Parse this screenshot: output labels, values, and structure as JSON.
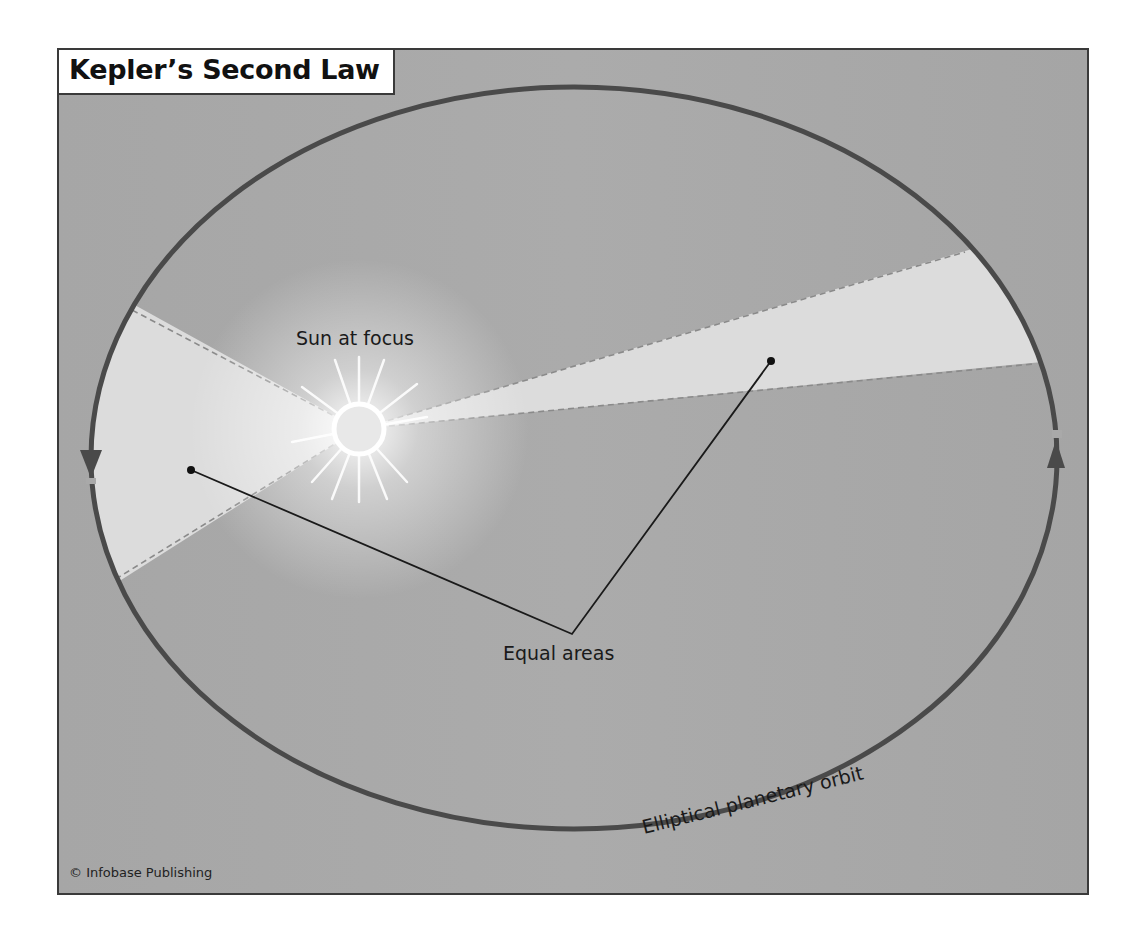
{
  "title": "Kepler’s Second Law",
  "labels": {
    "sun": "Sun at focus",
    "equal_areas": "Equal areas",
    "orbit": "Elliptical planetary orbit",
    "credit": "© Infobase Publishing"
  },
  "colors": {
    "background": "#a9a9a9",
    "orbit": "#4a4a4a",
    "wedge": "#dcdcdc",
    "frame": "#3a3a3a"
  },
  "icons": {
    "sun": "sun-icon",
    "orbit_arrows": [
      "arrow-down-icon",
      "arrow-up-icon"
    ]
  }
}
